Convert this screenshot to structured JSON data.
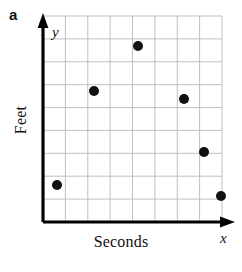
{
  "figure": {
    "part_label": "a",
    "background_color": "#ffffff"
  },
  "axes": {
    "x_variable_label": "x",
    "y_variable_label": "y",
    "x_axis_title": "Seconds",
    "y_axis_title": "Feet",
    "axis_color": "#000000",
    "grid_color": "#b9b9b9"
  },
  "chart_data": {
    "type": "scatter",
    "title": "a",
    "xlabel": "Seconds",
    "ylabel": "Feet",
    "xvar": "x",
    "yvar": "y",
    "grid": true,
    "legend": null,
    "xlim": [
      0,
      8
    ],
    "ylim": [
      0,
      9
    ],
    "x_tick_labels": [],
    "y_tick_labels": [],
    "grid_columns": 8,
    "grid_rows": 9,
    "marker": {
      "shape": "circle",
      "color": "#111111",
      "radius_px": 5
    },
    "points": [
      {
        "x": 0.6,
        "y": 1.6,
        "px": 57,
        "py": 185
      },
      {
        "x": 2.3,
        "y": 5.7,
        "px": 94,
        "py": 91
      },
      {
        "x": 4.2,
        "y": 7.7,
        "px": 138,
        "py": 46
      },
      {
        "x": 6.3,
        "y": 5.4,
        "px": 184,
        "py": 99
      },
      {
        "x": 7.2,
        "y": 3.1,
        "px": 204,
        "py": 152
      },
      {
        "x": 7.9,
        "y": 1.1,
        "px": 221,
        "py": 196
      }
    ]
  }
}
